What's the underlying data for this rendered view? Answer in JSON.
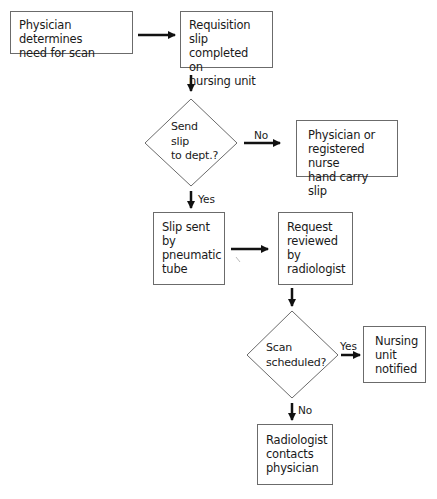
{
  "flowchart": {
    "nodes": [
      {
        "id": "physician-determines",
        "type": "process",
        "text": "Physician determines\nneed for scan"
      },
      {
        "id": "requisition-slip",
        "type": "process",
        "text": "Requisition slip\ncompleted on\nnursing unit"
      },
      {
        "id": "send-slip-decision",
        "type": "decision",
        "text": "Send\nslip\nto dept.?"
      },
      {
        "id": "hand-carry",
        "type": "process",
        "text": "Physician or\nregistered nurse\nhand carry slip"
      },
      {
        "id": "pneumatic-tube",
        "type": "process",
        "text": "Slip sent\nby\npneumatic\ntube"
      },
      {
        "id": "request-reviewed",
        "type": "process",
        "text": "Request\nreviewed\nby\nradiologist"
      },
      {
        "id": "scan-scheduled-decision",
        "type": "decision",
        "text": "Scan\nscheduled?"
      },
      {
        "id": "nursing-notified",
        "type": "process",
        "text": "Nursing\nunit\nnotified"
      },
      {
        "id": "radiologist-contacts",
        "type": "process",
        "text": "Radiologist\ncontacts\nphysician"
      }
    ],
    "edges": [
      {
        "from": "physician-determines",
        "to": "requisition-slip",
        "label": ""
      },
      {
        "from": "requisition-slip",
        "to": "send-slip-decision",
        "label": ""
      },
      {
        "from": "send-slip-decision",
        "to": "hand-carry",
        "label": "No"
      },
      {
        "from": "send-slip-decision",
        "to": "pneumatic-tube",
        "label": "Yes"
      },
      {
        "from": "pneumatic-tube",
        "to": "request-reviewed",
        "label": ""
      },
      {
        "from": "request-reviewed",
        "to": "scan-scheduled-decision",
        "label": ""
      },
      {
        "from": "scan-scheduled-decision",
        "to": "nursing-notified",
        "label": "Yes"
      },
      {
        "from": "scan-scheduled-decision",
        "to": "radiologist-contacts",
        "label": "No"
      }
    ],
    "colors": {
      "line": "#111111",
      "border": "#6b6b6b",
      "background": "#ffffff"
    }
  }
}
